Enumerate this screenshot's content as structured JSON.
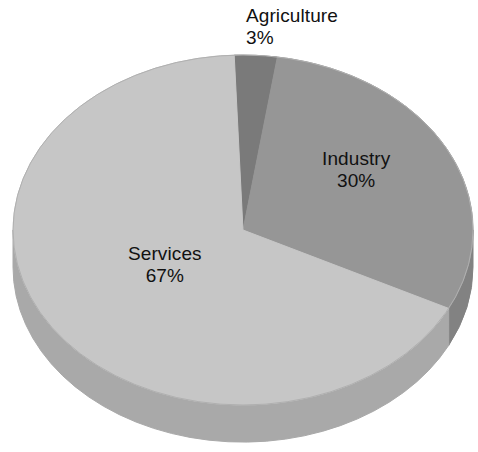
{
  "chart_data": {
    "type": "pie",
    "title": "",
    "subtitle": "",
    "xlabel": "",
    "ylabel": "",
    "legend_position": "none",
    "grid": false,
    "value_unit": "%",
    "three_d": true,
    "categories": [
      "Agriculture",
      "Industry",
      "Services"
    ],
    "values": [
      3,
      30,
      67
    ],
    "slices": [
      {
        "name": "Agriculture",
        "value": 3,
        "value_label": "3%",
        "color": "#7a7a7a",
        "side_color": "#6a6a6a",
        "label_placement": "outside-top"
      },
      {
        "name": "Industry",
        "value": 30,
        "value_label": "30%",
        "color": "#969696",
        "side_color": "#828282",
        "label_placement": "inside"
      },
      {
        "name": "Services",
        "value": 67,
        "value_label": "67%",
        "color": "#c6c6c6",
        "side_color": "#a9a9a9",
        "label_placement": "inside"
      }
    ],
    "background_color": "#ffffff",
    "text_color": "#111111"
  },
  "labels": {
    "agriculture": {
      "name": "Agriculture",
      "value": "3%"
    },
    "industry": {
      "name": "Industry",
      "value": "30%"
    },
    "services": {
      "name": "Services",
      "value": "67%"
    }
  }
}
